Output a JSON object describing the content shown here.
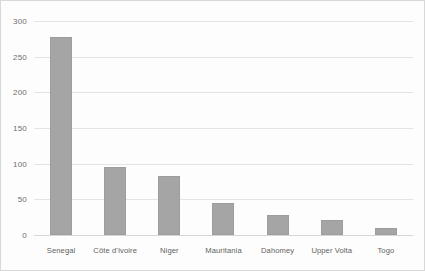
{
  "chart_data": {
    "type": "bar",
    "title": "",
    "subtitle": "",
    "xlabel": "",
    "ylabel": "",
    "categories": [
      "Senegal",
      "Côte d'Ivoire",
      "Niger",
      "Mauritania",
      "Dahomey",
      "Upper Volta",
      "Togo"
    ],
    "values": [
      278,
      96,
      83,
      45,
      28,
      21,
      10
    ],
    "ylim": [
      0,
      300
    ],
    "yticks": [
      0,
      50,
      100,
      150,
      200,
      250,
      300
    ],
    "ytick_labels": [
      "0",
      "50",
      "100",
      "150",
      "200",
      "250",
      "300"
    ],
    "grid": true,
    "grid_axis": "y",
    "legend": false,
    "legend_position": "none",
    "bar_color": "#a5a5a5",
    "gridline_color": "#e4e4e4",
    "axis_text_color": "#5f5f5f",
    "background_color": "#fdfdfd",
    "border_color": "#d8d8d8"
  }
}
